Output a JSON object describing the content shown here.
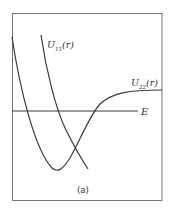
{
  "figure": {
    "caption": "(a)",
    "curve_u11_label": "U",
    "curve_u11_sub": "11",
    "curve_u11_arg": "(r)",
    "curve_u22_label": "U",
    "curve_u22_sub": "22",
    "curve_u22_arg": "(r)",
    "energy_label": "E",
    "line_color": "#3a3a3a",
    "frame_color": "#555555"
  }
}
